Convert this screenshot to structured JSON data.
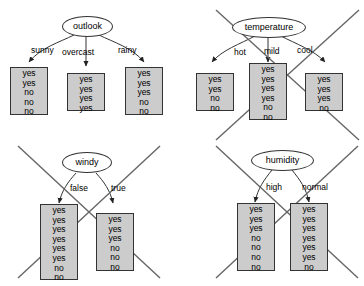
{
  "figure": {
    "colors": {
      "leaf_fill": "#cccccc",
      "leaf_border": "#333333",
      "node_border": "#333333",
      "cross_stroke": "#666666",
      "background": "#ffffff",
      "text": "#000000"
    },
    "canvas": {
      "width": 364,
      "height": 286
    }
  },
  "splits": [
    {
      "id": "outlook",
      "attribute": "outlook",
      "crossed_out": false,
      "quadrant": "top-left",
      "branches": [
        {
          "label": "sunny",
          "values": [
            "yes",
            "yes",
            "no",
            "no",
            "no"
          ],
          "counts": {
            "yes": 2,
            "no": 3,
            "total": 5
          }
        },
        {
          "label": "overcast",
          "values": [
            "yes",
            "yes",
            "yes",
            "yes"
          ],
          "counts": {
            "yes": 4,
            "no": 0,
            "total": 4
          }
        },
        {
          "label": "rainy",
          "values": [
            "yes",
            "yes",
            "yes",
            "no",
            "no"
          ],
          "counts": {
            "yes": 3,
            "no": 2,
            "total": 5
          }
        }
      ]
    },
    {
      "id": "temperature",
      "attribute": "temperature",
      "crossed_out": true,
      "quadrant": "top-right",
      "branches": [
        {
          "label": "hot",
          "values": [
            "yes",
            "yes",
            "no",
            "no"
          ],
          "counts": {
            "yes": 2,
            "no": 2,
            "total": 4
          }
        },
        {
          "label": "mild",
          "values": [
            "yes",
            "yes",
            "yes",
            "yes",
            "no",
            "no"
          ],
          "counts": {
            "yes": 4,
            "no": 2,
            "total": 6
          }
        },
        {
          "label": "cool",
          "values": [
            "yes",
            "yes",
            "yes",
            "no"
          ],
          "counts": {
            "yes": 3,
            "no": 1,
            "total": 4
          }
        }
      ]
    },
    {
      "id": "windy",
      "attribute": "windy",
      "crossed_out": true,
      "quadrant": "bottom-left",
      "branches": [
        {
          "label": "false",
          "values": [
            "yes",
            "yes",
            "yes",
            "yes",
            "yes",
            "yes",
            "no",
            "no"
          ],
          "counts": {
            "yes": 6,
            "no": 2,
            "total": 8
          }
        },
        {
          "label": "true",
          "values": [
            "yes",
            "yes",
            "yes",
            "no",
            "no",
            "no"
          ],
          "counts": {
            "yes": 3,
            "no": 3,
            "total": 6
          }
        }
      ]
    },
    {
      "id": "humidity",
      "attribute": "humidity",
      "crossed_out": true,
      "quadrant": "bottom-right",
      "branches": [
        {
          "label": "high",
          "values": [
            "yes",
            "yes",
            "yes",
            "no",
            "no",
            "no",
            "no"
          ],
          "counts": {
            "yes": 3,
            "no": 4,
            "total": 7
          }
        },
        {
          "label": "normal",
          "values": [
            "yes",
            "yes",
            "yes",
            "yes",
            "yes",
            "yes",
            "no"
          ],
          "counts": {
            "yes": 6,
            "no": 1,
            "total": 7
          }
        }
      ]
    }
  ]
}
